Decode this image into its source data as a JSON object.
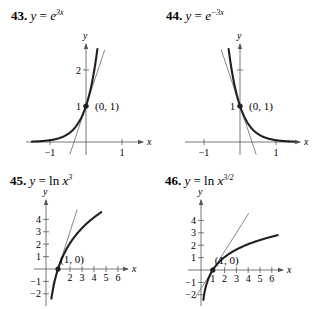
{
  "chart_data": [
    {
      "id": "43",
      "type": "line",
      "number": "43.",
      "title_parts": {
        "prefix": "y = ",
        "base": "e",
        "sup": "3x"
      },
      "function": "y = e^(3x)",
      "xlabel": "x",
      "ylabel": "y",
      "xlim": [
        -1.5,
        1.6
      ],
      "ylim": [
        -0.35,
        2.7
      ],
      "x_ticks": [
        {
          "v": -1,
          "label": "−1"
        },
        {
          "v": 1,
          "label": "1"
        }
      ],
      "y_ticks": [
        {
          "v": 1,
          "label": "1"
        },
        {
          "v": 2,
          "label": "2"
        }
      ],
      "point": {
        "x": 0,
        "y": 1,
        "label": "(0, 1)"
      },
      "tangent_line": {
        "slope": 3,
        "intercept": 1,
        "x_range": [
          -0.45,
          0.52
        ]
      },
      "curve_x_range": [
        -1.5,
        0.316
      ],
      "grid": false,
      "layout": {
        "origin_px": [
          86,
          142
        ],
        "scale_px": [
          36,
          36
        ],
        "title_pos": [
          11,
          20
        ],
        "x_axis_px": [
          26,
          143
        ],
        "y_axis_px": [
          155,
          44
        ]
      }
    },
    {
      "id": "44",
      "type": "line",
      "number": "44.",
      "title_parts": {
        "prefix": "y = ",
        "base": "e",
        "sup": "−3x"
      },
      "function": "y = e^(-3x)",
      "xlabel": "x",
      "ylabel": "y",
      "xlim": [
        -1.5,
        1.6
      ],
      "ylim": [
        -0.35,
        2.7
      ],
      "x_ticks": [
        {
          "v": -1,
          "label": "−1"
        },
        {
          "v": 1,
          "label": "1"
        }
      ],
      "y_ticks": [
        {
          "v": 1,
          "label": "1"
        },
        {
          "v": 2,
          "label": ""
        }
      ],
      "point": {
        "x": 0,
        "y": 1,
        "label": "(0, 1)"
      },
      "tangent_line": {
        "slope": -3,
        "intercept": 1,
        "x_range": [
          -0.52,
          0.45
        ]
      },
      "curve_x_range": [
        -0.316,
        1.5
      ],
      "grid": false,
      "layout": {
        "origin_px": [
          240,
          142
        ],
        "scale_px": [
          36,
          36
        ],
        "title_pos": [
          166,
          20
        ],
        "x_axis_px": [
          185,
          300
        ],
        "y_axis_px": [
          155,
          44
        ]
      }
    },
    {
      "id": "45",
      "type": "line",
      "number": "45.",
      "title_parts": {
        "prefix": "y = ln ",
        "base": "x",
        "sup": "3"
      },
      "function": "y = ln(x^3)",
      "xlabel": "x",
      "ylabel": "y",
      "xlim": [
        -0.8,
        7
      ],
      "ylim": [
        -2.6,
        5
      ],
      "x_ticks": [
        {
          "v": 1,
          "label": ""
        },
        {
          "v": 2,
          "label": "2"
        },
        {
          "v": 3,
          "label": "3"
        },
        {
          "v": 4,
          "label": "4"
        },
        {
          "v": 5,
          "label": "5"
        },
        {
          "v": 6,
          "label": "6"
        }
      ],
      "y_ticks": [
        {
          "v": -2,
          "label": "−2"
        },
        {
          "v": -1,
          "label": "−1"
        },
        {
          "v": 1,
          "label": "1"
        },
        {
          "v": 2,
          "label": "2"
        },
        {
          "v": 3,
          "label": "3"
        },
        {
          "v": 4,
          "label": "4"
        }
      ],
      "point": {
        "x": 1,
        "y": 0,
        "label": "(1, 0)"
      },
      "tangent_line": {
        "slope": 3,
        "intercept": -3,
        "x_range": [
          0.55,
          2.6
        ]
      },
      "curve_x_range": [
        0.45,
        4.6
      ],
      "grid": false,
      "layout": {
        "origin_px": [
          46,
          269
        ],
        "scale_px": [
          12,
          12.4
        ],
        "title_pos": [
          10,
          185
        ],
        "x_axis_px": [
          34,
          128
        ],
        "y_axis_px": [
          306,
          200
        ]
      }
    },
    {
      "id": "46",
      "type": "line",
      "number": "46.",
      "title_parts": {
        "prefix": "y = ln ",
        "base": "x",
        "sup": "3/2"
      },
      "function": "y = ln(x^(3/2))",
      "xlabel": "x",
      "ylabel": "y",
      "xlim": [
        -1,
        7
      ],
      "ylim": [
        -2.6,
        5
      ],
      "x_ticks": [
        {
          "v": 1,
          "label": "1"
        },
        {
          "v": 2,
          "label": "2"
        },
        {
          "v": 3,
          "label": "3"
        },
        {
          "v": 4,
          "label": "4"
        },
        {
          "v": 5,
          "label": "5"
        },
        {
          "v": 6,
          "label": "6"
        }
      ],
      "y_ticks": [
        {
          "v": -2,
          "label": "−2"
        },
        {
          "v": -1,
          "label": "−1"
        },
        {
          "v": 1,
          "label": "1"
        },
        {
          "v": 2,
          "label": "2"
        },
        {
          "v": 3,
          "label": "3"
        },
        {
          "v": 4,
          "label": "4"
        }
      ],
      "point": {
        "x": 1,
        "y": 0,
        "label": "(1, 0)"
      },
      "tangent_line": {
        "slope": 1.5,
        "intercept": -1.5,
        "x_range": [
          -0.55,
          4.05
        ]
      },
      "curve_x_range": [
        0.2,
        6.5
      ],
      "grid": false,
      "layout": {
        "origin_px": [
          201,
          270
        ],
        "scale_px": [
          11.8,
          12.4
        ],
        "title_pos": [
          165,
          185
        ],
        "x_axis_px": [
          188,
          283
        ],
        "y_axis_px": [
          306,
          200
        ]
      }
    }
  ],
  "colors": {
    "ink": "#231f20",
    "tangent": "#555555",
    "background": "#ffffff"
  }
}
